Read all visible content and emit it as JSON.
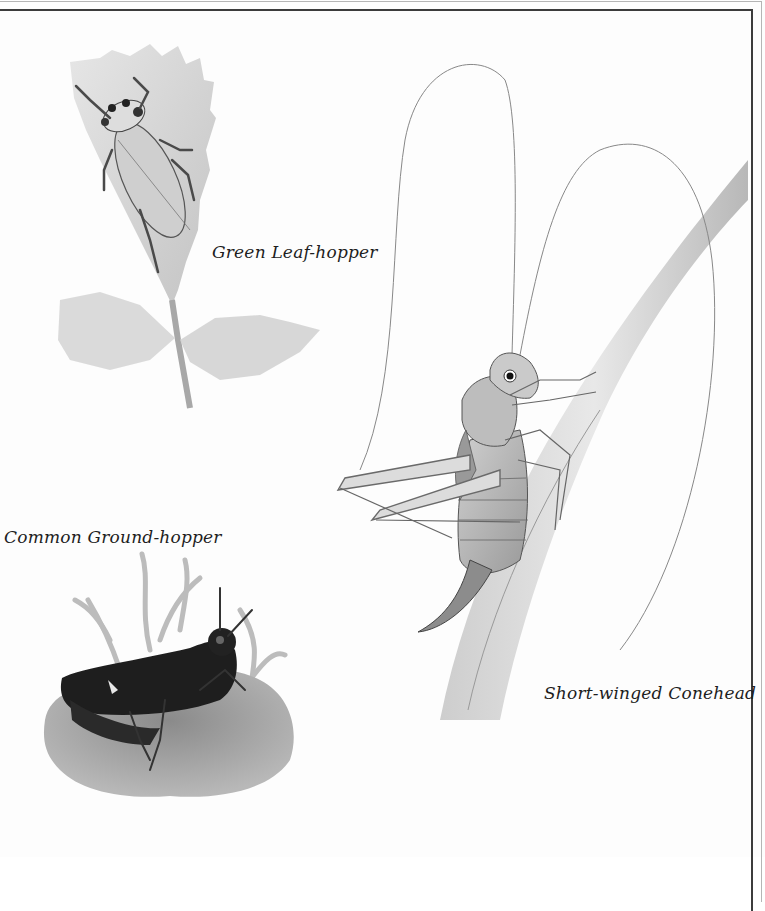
{
  "plate": {
    "illustrations": [
      {
        "id": "green-leafhopper",
        "caption": "Green Leaf-hopper"
      },
      {
        "id": "common-groundhopper",
        "caption": "Common Ground-hopper"
      },
      {
        "id": "short-winged-conehead",
        "caption": "Short-winged Conehead"
      }
    ],
    "colors": {
      "border_outer": "#b5b5b5",
      "border_inner": "#3c3c3c",
      "caption_text": "#1e1e1e"
    }
  }
}
